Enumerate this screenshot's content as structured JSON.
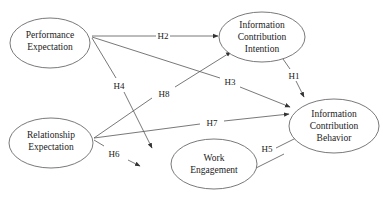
{
  "diagram": {
    "type": "structural-model",
    "nodes": [
      {
        "id": "PE",
        "lines": [
          "Performance",
          "Expectation"
        ],
        "cx": 50,
        "cy": 43,
        "rx": 40,
        "ry": 25
      },
      {
        "id": "ICI",
        "lines": [
          "Information",
          "Contribution",
          "Intention"
        ],
        "cx": 262,
        "cy": 37,
        "rx": 43,
        "ry": 25
      },
      {
        "id": "ICB",
        "lines": [
          "Information",
          "Contribution",
          "Behavior"
        ],
        "cx": 334,
        "cy": 126,
        "rx": 45,
        "ry": 27
      },
      {
        "id": "RE",
        "lines": [
          "Relationship",
          "Expectation"
        ],
        "cx": 51,
        "cy": 143,
        "rx": 42,
        "ry": 25
      },
      {
        "id": "WE",
        "lines": [
          "Work",
          "Engagement"
        ],
        "cx": 214,
        "cy": 164,
        "rx": 43,
        "ry": 25
      }
    ],
    "edges": [
      {
        "label": "H1",
        "from": "ICI",
        "to": "ICB"
      },
      {
        "label": "H2",
        "from": "PE",
        "to": "ICI"
      },
      {
        "label": "H3",
        "from": "PE",
        "to": "ICB"
      },
      {
        "label": "H4",
        "from": "PE",
        "to": "WE"
      },
      {
        "label": "H5",
        "from": "WE",
        "to": "ICB"
      },
      {
        "label": "H6",
        "from": "RE",
        "to": "WE"
      },
      {
        "label": "H7",
        "from": "RE",
        "to": "ICB"
      },
      {
        "label": "H8",
        "from": "RE",
        "to": "ICI"
      }
    ]
  },
  "nodes": {
    "pe": {
      "line1": "Performance",
      "line2": "Expectation"
    },
    "ici": {
      "line1": "Information",
      "line2": "Contribution",
      "line3": "Intention"
    },
    "icb": {
      "line1": "Information",
      "line2": "Contribution",
      "line3": "Behavior"
    },
    "re": {
      "line1": "Relationship",
      "line2": "Expectation"
    },
    "we": {
      "line1": "Work",
      "line2": "Engagement"
    }
  },
  "edges": {
    "h1": "H1",
    "h2": "H2",
    "h3": "H3",
    "h4": "H4",
    "h5": "H5",
    "h6": "H6",
    "h7": "H7",
    "h8": "H8"
  }
}
